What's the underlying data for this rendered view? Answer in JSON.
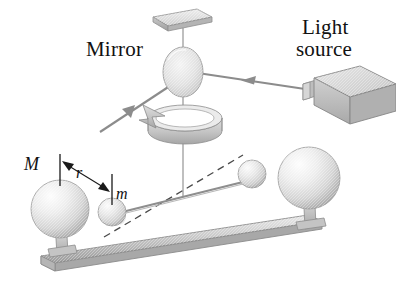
{
  "figure": {
    "background_color": "#ffffff",
    "width": 396,
    "height": 281,
    "labels": {
      "mirror": "Mirror",
      "light_source_line1": "Light",
      "light_source_line2": "source",
      "large_mass": "M",
      "separation": "r",
      "small_mass": "m"
    },
    "colors": {
      "ink": "#111111",
      "sphere_light": "#f2f2f2",
      "sphere_mid": "#c9c9c9",
      "sphere_dark": "#9a9a9a",
      "metal_light": "#e3e3e3",
      "metal_mid": "#c0c0c0",
      "metal_dark": "#949494",
      "beam_line": "#8c8c8c",
      "rod_line": "#909090",
      "dashed_line": "#555555"
    },
    "parts": [
      {
        "name": "ceiling-mount-plate",
        "kind": "plate"
      },
      {
        "name": "torsion-fiber",
        "kind": "line"
      },
      {
        "name": "mirror-disc",
        "kind": "ellipse"
      },
      {
        "name": "incident-light-ray",
        "kind": "arrow"
      },
      {
        "name": "reflected-light-ray",
        "kind": "arrow"
      },
      {
        "name": "rotation-indicator",
        "kind": "ring-arrow"
      },
      {
        "name": "light-source-box",
        "kind": "box"
      },
      {
        "name": "torsion-rod",
        "kind": "rod"
      },
      {
        "name": "small-sphere-left",
        "kind": "sphere"
      },
      {
        "name": "small-sphere-right",
        "kind": "sphere"
      },
      {
        "name": "large-sphere-left",
        "kind": "sphere"
      },
      {
        "name": "large-sphere-right",
        "kind": "sphere"
      },
      {
        "name": "support-rail",
        "kind": "rail"
      },
      {
        "name": "undeflected-rod-dashed",
        "kind": "dashed"
      },
      {
        "name": "separation-dimension",
        "kind": "dimension"
      }
    ]
  }
}
